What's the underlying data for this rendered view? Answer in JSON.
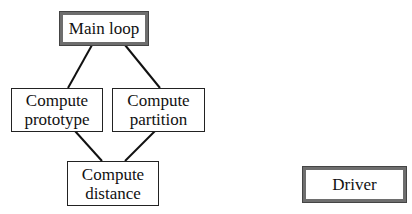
{
  "diagram": {
    "nodes": [
      {
        "id": "main-loop",
        "label": "Main loop",
        "style": "thick"
      },
      {
        "id": "compute-prototype",
        "label": "Compute\nprototype",
        "style": "thin"
      },
      {
        "id": "compute-partition",
        "label": "Compute\npartition",
        "style": "thin"
      },
      {
        "id": "compute-distance",
        "label": "Compute\ndistance",
        "style": "thin"
      },
      {
        "id": "driver",
        "label": "Driver",
        "style": "thick"
      }
    ],
    "edges": [
      {
        "from": "main-loop",
        "to": "compute-prototype"
      },
      {
        "from": "main-loop",
        "to": "compute-partition"
      },
      {
        "from": "compute-prototype",
        "to": "compute-distance"
      },
      {
        "from": "compute-partition",
        "to": "compute-distance"
      }
    ],
    "colors": {
      "thick_border": "#6e6e6e",
      "thin_border": "#222222",
      "edge": "#111111",
      "background": "#ffffff"
    }
  }
}
